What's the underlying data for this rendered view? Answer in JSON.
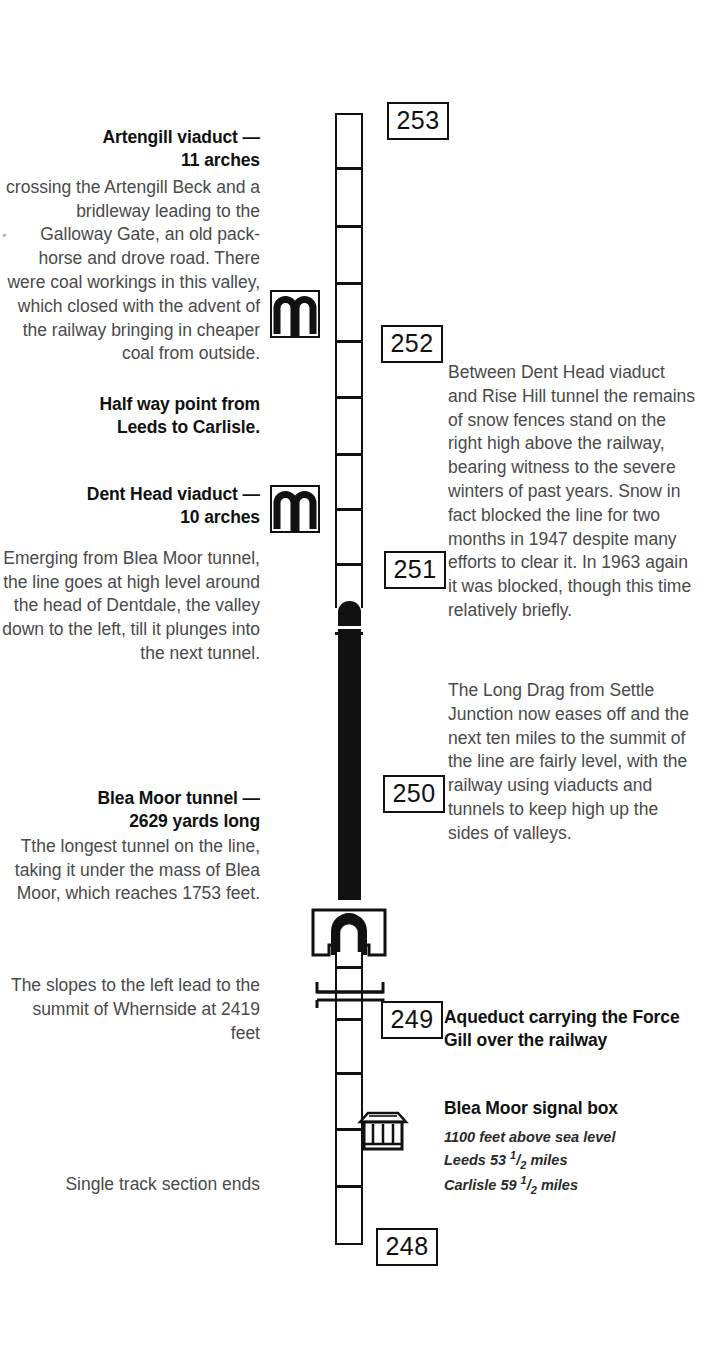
{
  "page": {
    "background_color": "#ffffff",
    "ink_color": "#111111"
  },
  "left_column": [
    {
      "id": "artengill",
      "heading_line1": "Artengill viaduct —",
      "heading_line2": "11 arches",
      "body": "crossing the Artengill Beck and a bridleway leading to the Galloway Gate, an old pack-horse and drove road. There were coal workings in this valley, which closed with the advent of the railway bringing in cheaper coal from outside."
    },
    {
      "id": "halfway",
      "heading_line1": "Half way point from",
      "heading_line2": "Leeds to Carlisle.",
      "body": ""
    },
    {
      "id": "dent-head",
      "heading_line1": "Dent Head viaduct —",
      "heading_line2": "10 arches",
      "body": "Emerging from Blea Moor tunnel, the line goes at high level around the head of Dentdale, the valley down to the left, till it plunges into the next tunnel."
    },
    {
      "id": "blea-moor-tunnel",
      "heading_line1": "Blea Moor tunnel —",
      "heading_line2": "2629 yards long",
      "body": "Tthe longest tunnel on the line, taking it under the mass of Blea Moor, which reaches 1753 feet."
    },
    {
      "id": "whernside",
      "heading_line1": "",
      "heading_line2": "",
      "body": "The slopes to the left lead to the summit of Whernside at 2419 feet"
    },
    {
      "id": "single-track-ends",
      "heading_line1": "",
      "heading_line2": "",
      "body": "Single track section ends"
    }
  ],
  "right_column": [
    {
      "id": "snow-fences",
      "heading": "",
      "body": "Between Dent Head viaduct and Rise Hill tunnel the remains of snow fences stand on the right high above the railway, bearing witness to the severe winters of past years. Snow in fact blocked the line for two months in 1947 despite many efforts to clear it. In 1963 again it was blocked, though this time relatively briefly."
    },
    {
      "id": "long-drag",
      "heading": "",
      "body": "The Long Drag from Settle Junction now eases off and the next ten miles to the summit of the line are fairly level, with the railway using viaducts and tunnels to keep high up the sides of valleys."
    },
    {
      "id": "aqueduct",
      "heading": "Aqueduct carrying the Force Gill over the railway",
      "body": ""
    },
    {
      "id": "signal-box",
      "heading": "Blea Moor signal box",
      "body": "",
      "detail_lines": [
        "1100 feet above sea level",
        "Leeds 53 1/2 miles",
        "Carlisle 59 1/2 miles"
      ],
      "detail_parts": [
        {
          "pre": "1100 feet above sea level",
          "num": "",
          "den": "",
          "post": ""
        },
        {
          "pre": "Leeds 53 ",
          "num": "1",
          "den": "2",
          "post": " miles"
        },
        {
          "pre": "Carlisle 59 ",
          "num": "1",
          "den": "2",
          "post": " miles"
        }
      ]
    }
  ],
  "mileposts": [
    {
      "label": "253"
    },
    {
      "label": "252"
    },
    {
      "label": "251"
    },
    {
      "label": "250"
    },
    {
      "label": "249"
    },
    {
      "label": "248"
    }
  ],
  "icons": [
    {
      "name": "viaduct-icon",
      "label": "Artengill viaduct symbol"
    },
    {
      "name": "viaduct-icon",
      "label": "Dent Head viaduct symbol"
    },
    {
      "name": "tunnel-portal-icon",
      "label": "Blea Moor tunnel south portal"
    },
    {
      "name": "aqueduct-icon",
      "label": "Force Gill aqueduct symbol"
    },
    {
      "name": "signal-box-icon",
      "label": "Blea Moor signal box symbol"
    }
  ],
  "track": {
    "description": "Vertical railway line with mile tick marks; solid black section denotes tunnel",
    "tunnel_label": "Blea Moor tunnel"
  },
  "stray_mark": "•"
}
